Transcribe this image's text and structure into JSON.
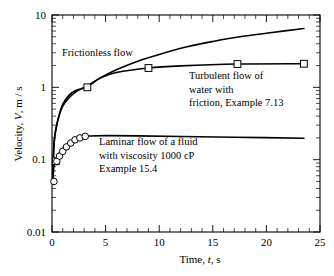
{
  "chart_data": {
    "type": "line",
    "title": "",
    "xlabel": "Time, t, s",
    "ylabel": "Velocity, V, m / s",
    "xlim": [
      0,
      25
    ],
    "ylim": [
      0.01,
      10
    ],
    "yscale": "log",
    "xscale": "linear",
    "grid": false,
    "legend": "none",
    "xticks": [
      "0",
      "5",
      "10",
      "15",
      "20",
      "25"
    ],
    "xtick_values": [
      0,
      5,
      10,
      15,
      20,
      25
    ],
    "yticks": [
      "10",
      "1",
      "0.1",
      "0.01"
    ],
    "ytick_values": [
      10,
      1,
      0.1,
      0.01
    ],
    "series": [
      {
        "name": "Frictionless flow",
        "marker": "none",
        "x": [
          0.05,
          0.2,
          0.5,
          1.0,
          1.6,
          2.3,
          3.3,
          4.5,
          6.0,
          8.0,
          10.0,
          12.5,
          15.0,
          17.5,
          20.0,
          23.5
        ],
        "y": [
          0.05,
          0.18,
          0.33,
          0.55,
          0.72,
          0.88,
          1.05,
          1.35,
          1.75,
          2.3,
          2.85,
          3.6,
          4.3,
          5.0,
          5.6,
          6.5
        ]
      },
      {
        "name": "Turbulent flow of water with friction, Example 7.13",
        "marker": "square",
        "x": [
          0.05,
          0.2,
          0.4,
          0.6,
          1.0,
          1.6,
          2.3,
          3.3,
          4.5,
          6.0,
          9.0,
          12.0,
          17.3,
          23.5
        ],
        "y": [
          0.05,
          0.17,
          0.28,
          0.38,
          0.58,
          0.78,
          0.92,
          1.02,
          1.35,
          1.6,
          1.85,
          1.98,
          2.1,
          2.12
        ],
        "marker_points": [
          {
            "x": 0.35,
            "y": 0.095
          },
          {
            "x": 3.3,
            "y": 1.0
          },
          {
            "x": 9.0,
            "y": 1.85
          },
          {
            "x": 17.3,
            "y": 2.1
          },
          {
            "x": 23.5,
            "y": 2.12
          }
        ]
      },
      {
        "name": "Laminar flow of a fluid with viscosity 1000 cP, Example 15.4",
        "marker": "circle",
        "x": [
          0.05,
          0.2,
          0.35,
          0.5,
          0.7,
          1.0,
          1.3,
          1.7,
          2.1,
          2.5,
          3.0,
          3.5,
          5.0,
          8.0,
          12.0,
          17.0,
          23.5
        ],
        "y": [
          0.05,
          0.085,
          0.1,
          0.112,
          0.125,
          0.142,
          0.157,
          0.173,
          0.187,
          0.198,
          0.207,
          0.212,
          0.215,
          0.213,
          0.209,
          0.204,
          0.198
        ],
        "marker_points": [
          {
            "x": 0.18,
            "y": 0.05
          },
          {
            "x": 0.45,
            "y": 0.095
          },
          {
            "x": 0.7,
            "y": 0.112
          },
          {
            "x": 1.0,
            "y": 0.13
          },
          {
            "x": 1.35,
            "y": 0.15
          },
          {
            "x": 1.75,
            "y": 0.17
          },
          {
            "x": 2.15,
            "y": 0.188
          },
          {
            "x": 2.6,
            "y": 0.2
          },
          {
            "x": 3.1,
            "y": 0.21
          }
        ]
      }
    ],
    "annotations": [
      {
        "name": "frictionless-label",
        "lines": [
          "Frictionless flow"
        ],
        "x": 2.0,
        "y": 4.2
      },
      {
        "name": "turbulent-label",
        "lines": [
          "Turbulent flow of",
          "water with",
          "friction, Example 7.13"
        ],
        "x": 11.5,
        "y": 1.35
      },
      {
        "name": "laminar-label",
        "lines": [
          "Laminar flow of a fluid",
          "with viscosity 1000 cP",
          "Example 15.4"
        ],
        "x": 4.3,
        "y": 0.165
      }
    ]
  },
  "axes": {
    "y_label_parts": {
      "pre": "Velocity, ",
      "symbol": "V",
      "post": ", m / s"
    },
    "x_label_parts": {
      "pre": "Time, ",
      "symbol": "t",
      "post": ", s"
    }
  }
}
